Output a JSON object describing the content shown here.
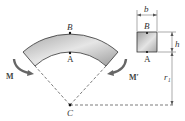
{
  "figure": {
    "labels": {
      "outer_point": "B",
      "inner_point": "A",
      "center": "C",
      "moment_left": "M",
      "moment_right": "M′",
      "section_outer": "B",
      "section_inner": "A",
      "width": "b",
      "height": "h",
      "radius": "r₁"
    },
    "colors": {
      "bar_fill_light": "#e8e8e8",
      "bar_fill_dark": "#9a9a9a",
      "outline": "#333333",
      "arrow": "#666666",
      "dash": "#444444"
    }
  }
}
